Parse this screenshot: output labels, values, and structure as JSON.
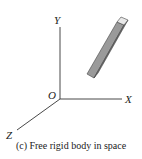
{
  "figure": {
    "caption": "(c) Free rigid body in space",
    "axes": {
      "x_label": "X",
      "y_label": "Y",
      "z_label": "Z",
      "origin_label": "O"
    },
    "body": {
      "description": "rigid bar",
      "colors": {
        "top": "#e8e8e8",
        "front": "#9a9a9a",
        "side": "#6e6e6e",
        "edge": "#444444"
      }
    },
    "axis_color": "#333333"
  }
}
